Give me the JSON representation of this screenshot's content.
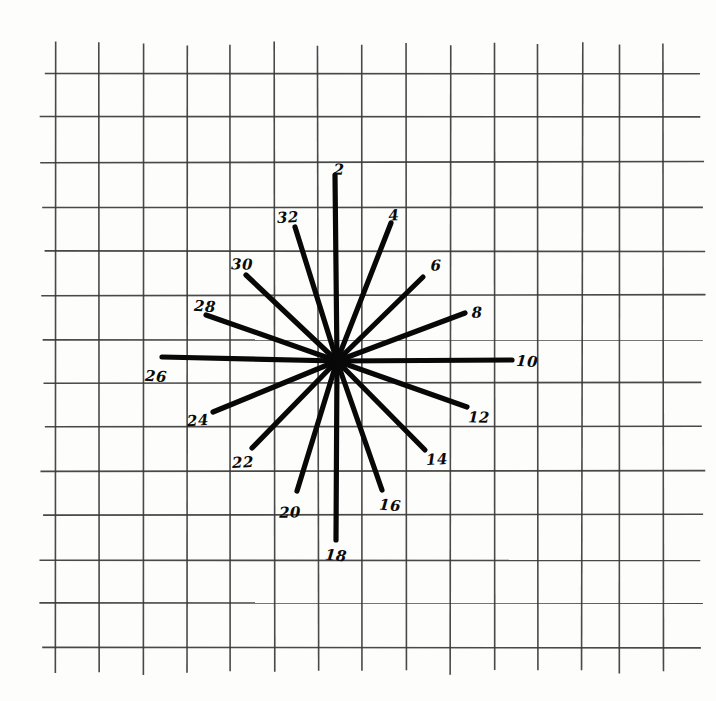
{
  "figure": {
    "background_color": "#fdfdfc",
    "ink_color": "#080808",
    "grid_color": "#3a3a3a"
  },
  "grid": {
    "vertical_line_x": [
      55,
      99.5,
      143.5,
      187.5,
      230,
      274,
      318,
      362,
      406,
      450,
      494,
      538,
      582,
      619,
      663
    ],
    "horizontal_line_y": [
      73,
      117,
      162,
      207,
      251,
      295,
      340,
      383,
      427,
      471,
      515,
      560,
      603,
      648
    ],
    "vertical_span": [
      44,
      672
    ],
    "horizontal_span": [
      43,
      702
    ],
    "spacing_px": 44.5,
    "columns": 14,
    "rows": 13
  },
  "chart_data": {
    "type": "scatter",
    "xlabel": "",
    "ylabel": "",
    "center": {
      "x": 337,
      "y": 361
    },
    "ray_count": 16,
    "angle_step_degrees": 22.5,
    "series": [
      {
        "name": "rays",
        "values": [
          {
            "label": "2",
            "angle_deg": 0,
            "length": 188,
            "end_x": 335,
            "end_y": 175,
            "label_x": 339,
            "label_y": 170
          },
          {
            "label": "4",
            "angle_deg": 22.5,
            "length": 152,
            "end_x": 391,
            "end_y": 223,
            "label_x": 394,
            "label_y": 216
          },
          {
            "label": "6",
            "angle_deg": 45,
            "length": 120,
            "end_x": 423,
            "end_y": 277,
            "label_x": 436,
            "label_y": 266
          },
          {
            "label": "8",
            "angle_deg": 67.5,
            "length": 140,
            "end_x": 465,
            "end_y": 313,
            "label_x": 477,
            "label_y": 313
          },
          {
            "label": "10",
            "angle_deg": 90,
            "length": 175,
            "end_x": 512,
            "end_y": 360,
            "label_x": 527,
            "label_y": 362
          },
          {
            "label": "12",
            "angle_deg": 112.5,
            "length": 144,
            "end_x": 467,
            "end_y": 407,
            "label_x": 479,
            "label_y": 418
          },
          {
            "label": "14",
            "angle_deg": 135,
            "length": 124,
            "end_x": 425,
            "end_y": 450,
            "label_x": 437,
            "label_y": 460
          },
          {
            "label": "16",
            "angle_deg": 157.5,
            "length": 140,
            "end_x": 382,
            "end_y": 490,
            "label_x": 390,
            "label_y": 506
          },
          {
            "label": "18",
            "angle_deg": 180,
            "length": 179,
            "end_x": 336,
            "end_y": 540,
            "label_x": 336,
            "label_y": 556
          },
          {
            "label": "20",
            "angle_deg": 202.5,
            "length": 136,
            "end_x": 297,
            "end_y": 491,
            "label_x": 290,
            "label_y": 513
          },
          {
            "label": "22",
            "angle_deg": 225,
            "length": 121,
            "end_x": 252,
            "end_y": 448,
            "label_x": 243,
            "label_y": 463
          },
          {
            "label": "24",
            "angle_deg": 247.5,
            "length": 132,
            "end_x": 213,
            "end_y": 412,
            "label_x": 198,
            "label_y": 421
          },
          {
            "label": "26",
            "angle_deg": 270,
            "length": 178,
            "end_x": 162,
            "end_y": 357,
            "label_x": 156,
            "label_y": 377
          },
          {
            "label": "28",
            "angle_deg": 292.5,
            "length": 135,
            "end_x": 206,
            "end_y": 315,
            "label_x": 205,
            "label_y": 307
          },
          {
            "label": "30",
            "angle_deg": 315,
            "length": 136,
            "end_x": 246,
            "end_y": 275,
            "label_x": 242,
            "label_y": 265
          },
          {
            "label": "32",
            "angle_deg": 337.5,
            "length": 156,
            "end_x": 295,
            "end_y": 227,
            "label_x": 288,
            "label_y": 218
          }
        ]
      }
    ],
    "legend": "none",
    "grid": true
  }
}
